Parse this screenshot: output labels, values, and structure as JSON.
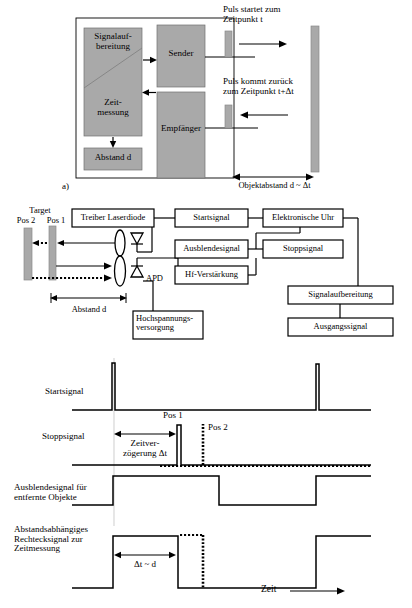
{
  "figure": {
    "panel_a": {
      "tag": "a)",
      "blocks": {
        "signal_processing_l1": "Signalauf-",
        "signal_processing_l2": "bereitung",
        "time_measurement_l1": "Zeit-",
        "time_measurement_l2": "messung",
        "distance": "Abstand d",
        "transmitter": "Sender",
        "receiver": "Empfänger"
      },
      "annotations": {
        "pulse_start_l1": "Puls startet zum",
        "pulse_start_l2": "Zeitpunkt t",
        "pulse_return_l1": "Puls kommt zurück",
        "pulse_return_l2": "zum Zeitpunkt t+Δt",
        "object_distance": "Objektabstand d ~ Δt"
      }
    },
    "panel_b": {
      "target_title": "Target",
      "pos2": "Pos 2",
      "pos1": "Pos 1",
      "distance": "Abstand  d",
      "apd": "APD",
      "boxes": {
        "laser_driver": "Treiber Laserdiode",
        "start_signal": "Startsignal",
        "electronic_clock": "Elektronische Uhr",
        "blanking_signal": "Ausblendesignal",
        "stop_signal": "Stoppsignal",
        "hf_amplifier": "Hf-Verstärkung",
        "signal_processing": "Signalaufbereitung",
        "output_signal": "Ausgangssignal",
        "high_voltage_l1": "Hochspannungs-",
        "high_voltage_l2": "versorgung"
      }
    },
    "panel_c": {
      "traces": [
        {
          "label_l1": "Startsignal",
          "label_l2": "",
          "label_l3": ""
        },
        {
          "label_l1": "Stoppsignal",
          "label_l2": "",
          "label_l3": ""
        },
        {
          "label_l1": "Ausblendesignal für",
          "label_l2": "entfernte Objekte",
          "label_l3": ""
        },
        {
          "label_l1": "Abstandsabhängiges",
          "label_l2": "Rechtecksignal zur",
          "label_l3": "Zeitmessung"
        }
      ],
      "annotations": {
        "pos1": "Pos 1",
        "pos2": "Pos 2",
        "delay_l1": "Zeitver-",
        "delay_l2": "zögerung Δt",
        "delta_t_d": "Δt ~ d",
        "time_axis": "Zeit"
      }
    }
  },
  "colors": {
    "gray_fill": "#a9a9a9",
    "stroke": "#000000",
    "background": "#ffffff"
  }
}
